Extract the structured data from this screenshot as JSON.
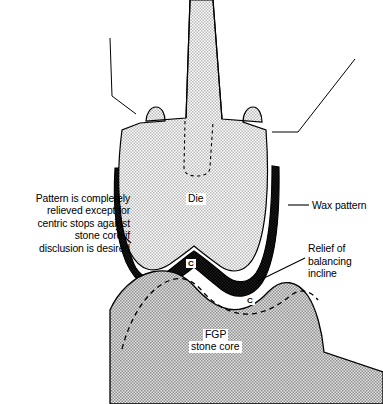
{
  "figure": {
    "domain": "anatomical-dental-diagram",
    "title_visible": false,
    "background_color": "#ffffff",
    "line_color": "#000000",
    "die_fill": "#d2d2d2",
    "wax_fill": "#000000",
    "stone_core_fill": "#b0b0b0"
  },
  "labels": {
    "die": "Die",
    "fgp_line1": "FGP",
    "fgp_line2": "stone core",
    "wax_pattern": "Wax pattern",
    "centric_stop_1": "C",
    "centric_stop_2": "C"
  },
  "annotations": {
    "left_note": {
      "line1": "Pattern is completely",
      "line2": "relieved except for",
      "line3": "centric stops against",
      "line4": "stone core if",
      "line5": "disclusion is desired"
    },
    "relief_note": {
      "line1": "Relief of",
      "line2": "balancing",
      "line3": "incline"
    }
  },
  "parts": [
    {
      "name": "die",
      "description": "light gray stippled die with tapered post"
    },
    {
      "name": "wax-pattern",
      "description": "black wax pattern band around die"
    },
    {
      "name": "fgp-stone-core",
      "description": "gray stippled functionally generated path stone core"
    },
    {
      "name": "hidden-outline",
      "description": "dashed internal post outline in die"
    },
    {
      "name": "relieved-contour",
      "description": "dashed curve across stone core"
    }
  ]
}
